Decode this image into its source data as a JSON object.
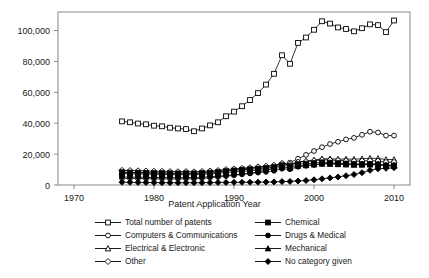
{
  "chart_data": {
    "type": "line",
    "title": "",
    "xlabel": "Patent Application Year",
    "ylabel": "",
    "xlim": [
      1968,
      2012
    ],
    "ylim": [
      0,
      112000
    ],
    "grid": false,
    "legend_position": "below",
    "xticks": [
      1970,
      1980,
      1990,
      2000,
      2010
    ],
    "xtick_labels": [
      "1970",
      "1980",
      "1990",
      "2000",
      "2010"
    ],
    "yticks": [
      0,
      20000,
      40000,
      60000,
      80000,
      100000
    ],
    "ytick_labels": [
      "0",
      "20,000",
      "40,000",
      "60,000",
      "80,000",
      "100,000"
    ],
    "x": [
      1976,
      1977,
      1978,
      1979,
      1980,
      1981,
      1982,
      1983,
      1984,
      1985,
      1986,
      1987,
      1988,
      1989,
      1990,
      1991,
      1992,
      1993,
      1994,
      1995,
      1996,
      1997,
      1998,
      1999,
      2000,
      2001,
      2002,
      2003,
      2004,
      2005,
      2006,
      2007,
      2008,
      2009,
      2010
    ],
    "series": [
      {
        "name": "Total number of patents",
        "marker": "open-square",
        "values": [
          41200,
          40600,
          39800,
          39300,
          38400,
          38000,
          37100,
          36600,
          36200,
          34800,
          36600,
          38600,
          40600,
          44500,
          47500,
          51000,
          55000,
          59500,
          65000,
          72000,
          84000,
          78500,
          92000,
          95500,
          100500,
          106000,
          104500,
          102000,
          101000,
          99500,
          101500,
          104000,
          103500,
          99000,
          106500
        ]
      },
      {
        "name": "Computers & Communications",
        "marker": "open-circle",
        "values": [
          4400,
          4300,
          4200,
          4100,
          4000,
          4050,
          4000,
          3950,
          4100,
          4000,
          4300,
          4700,
          5100,
          5700,
          6200,
          6900,
          7600,
          8500,
          9500,
          11000,
          13500,
          14500,
          17000,
          19500,
          22000,
          24500,
          26500,
          28000,
          29500,
          30500,
          32500,
          34500,
          34000,
          32000,
          32000
        ]
      },
      {
        "name": "Electrical & Electronic",
        "marker": "open-triangle",
        "values": [
          8400,
          8200,
          8100,
          7900,
          7800,
          7800,
          7700,
          7600,
          7700,
          7600,
          7900,
          8300,
          8800,
          9400,
          9800,
          10400,
          10800,
          11300,
          11800,
          12500,
          13800,
          13300,
          15000,
          15500,
          16200,
          17000,
          17000,
          16800,
          16800,
          16700,
          17000,
          17300,
          17200,
          16500,
          16500
        ]
      },
      {
        "name": "Other",
        "marker": "open-diamond",
        "values": [
          9500,
          9400,
          9200,
          9100,
          8900,
          8900,
          8700,
          8600,
          8700,
          8500,
          8800,
          9100,
          9400,
          10000,
          10400,
          10800,
          11200,
          11700,
          12200,
          12800,
          14000,
          13300,
          14800,
          15200,
          15700,
          16300,
          16200,
          15900,
          15700,
          15400,
          15500,
          15700,
          15500,
          14700,
          14700
        ]
      },
      {
        "name": "Chemical",
        "marker": "filled-square",
        "values": [
          8300,
          8100,
          8000,
          7800,
          7700,
          7700,
          7600,
          7500,
          7600,
          7500,
          7700,
          8000,
          8400,
          9000,
          9400,
          9900,
          10200,
          10600,
          11000,
          11600,
          12800,
          12200,
          13500,
          13800,
          14200,
          14700,
          14500,
          14200,
          13900,
          13500,
          13400,
          13400,
          13200,
          12500,
          12500
        ]
      },
      {
        "name": "Drugs & Medical",
        "marker": "filled-circle",
        "values": [
          5200,
          5100,
          5000,
          4900,
          4800,
          4850,
          4800,
          4750,
          4850,
          4800,
          5000,
          5300,
          5700,
          6200,
          6600,
          7100,
          7500,
          8000,
          8500,
          9200,
          10500,
          10200,
          11800,
          12400,
          13000,
          13800,
          14000,
          13800,
          13700,
          13500,
          13600,
          13800,
          13600,
          12900,
          12900
        ]
      },
      {
        "name": "Mechanical",
        "marker": "filled-triangle",
        "values": [
          7400,
          7300,
          7200,
          7000,
          6900,
          6900,
          6800,
          6700,
          6800,
          6700,
          6900,
          7200,
          7600,
          8100,
          8500,
          8900,
          9200,
          9600,
          10000,
          10500,
          11600,
          11100,
          12400,
          12800,
          13200,
          13700,
          13600,
          13400,
          13200,
          13000,
          13100,
          13200,
          13000,
          12300,
          12300
        ]
      },
      {
        "name": "No category given",
        "marker": "filled-diamond",
        "values": [
          1800,
          1700,
          1650,
          1600,
          1550,
          1500,
          1500,
          1450,
          1500,
          1450,
          1500,
          1550,
          1600,
          1650,
          1700,
          1750,
          1800,
          1850,
          1900,
          2000,
          2200,
          2300,
          2600,
          2900,
          3400,
          4000,
          4600,
          5200,
          6000,
          6800,
          8000,
          9500,
          10500,
          10800,
          11200
        ]
      }
    ]
  },
  "legend": {
    "items": [
      {
        "label": "Total number of patents",
        "marker": "open-square"
      },
      {
        "label": "Chemical",
        "marker": "filled-square"
      },
      {
        "label": "Computers & Communications",
        "marker": "open-circle"
      },
      {
        "label": "Drugs & Medical",
        "marker": "filled-circle"
      },
      {
        "label": "Electrical & Electronic",
        "marker": "open-triangle"
      },
      {
        "label": "Mechanical",
        "marker": "filled-triangle"
      },
      {
        "label": "Other",
        "marker": "open-diamond"
      },
      {
        "label": "No category given",
        "marker": "filled-diamond"
      }
    ]
  },
  "colors": {
    "line": "#000000",
    "frame": "#888888",
    "text": "#1a1a1a",
    "background": "#ffffff"
  }
}
